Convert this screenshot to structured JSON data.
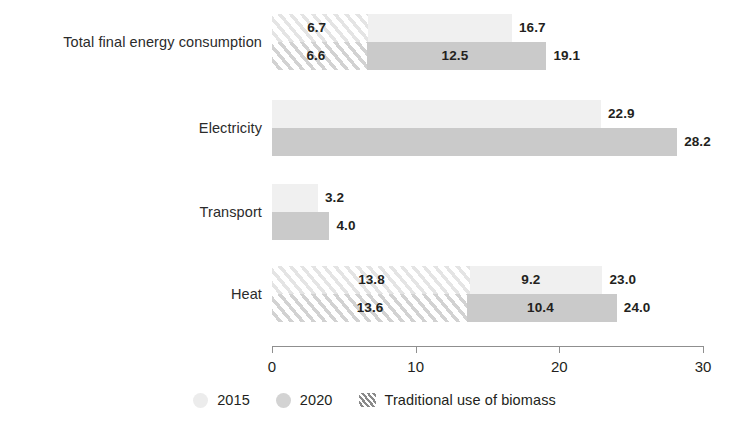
{
  "chart_data": {
    "type": "bar",
    "orientation": "horizontal",
    "stacked": true,
    "title": "",
    "subtitle": "",
    "xlabel": "",
    "ylabel": "",
    "xlim": [
      0,
      30
    ],
    "grid": false,
    "legend_position": "bottom-center",
    "categories": [
      "Total final energy consumption",
      "Electricity",
      "Transport",
      "Heat"
    ],
    "tick_labels": [
      "0",
      "10",
      "20",
      "30"
    ],
    "ticks": [
      0,
      10,
      20,
      30
    ],
    "legend": [
      {
        "name": "2015",
        "label": "2015",
        "color": "#ececec",
        "style": "solid"
      },
      {
        "name": "2020",
        "label": "2020",
        "color": "#d3d3d3",
        "style": "solid"
      },
      {
        "name": "traditional-biomass",
        "label": "Traditional use of biomass",
        "color": "#8a8a8a",
        "style": "hatched"
      }
    ],
    "series": [
      {
        "name": "2015",
        "biomass_values": [
          6.7,
          0,
          0,
          13.8
        ],
        "modern_values": [
          10.0,
          22.9,
          3.2,
          9.2
        ],
        "totals": [
          16.7,
          22.9,
          3.2,
          23.0
        ],
        "biomass_labels": [
          "6.7",
          "",
          "",
          "13.8"
        ],
        "modern_labels": [
          "",
          "",
          "",
          "9.2"
        ],
        "total_labels": [
          "16.7",
          "22.9",
          "3.2",
          "23.0"
        ]
      },
      {
        "name": "2020",
        "biomass_values": [
          6.6,
          0,
          0,
          13.6
        ],
        "modern_values": [
          12.5,
          28.2,
          4.0,
          10.4
        ],
        "totals": [
          19.1,
          28.2,
          4.0,
          24.0
        ],
        "biomass_labels": [
          "6.6",
          "",
          "",
          "13.6"
        ],
        "modern_labels": [
          "12.5",
          "",
          "",
          "10.4"
        ],
        "total_labels": [
          "19.1",
          "28.2",
          "4.0",
          "24.0"
        ]
      }
    ]
  },
  "colors": {
    "series_2015": "#f0f0f0",
    "series_2020": "#cacaca",
    "hatch_line": "#d2d2d2",
    "axis": "#8f8f8f",
    "text": "#231f20",
    "background": "#ffffff"
  }
}
